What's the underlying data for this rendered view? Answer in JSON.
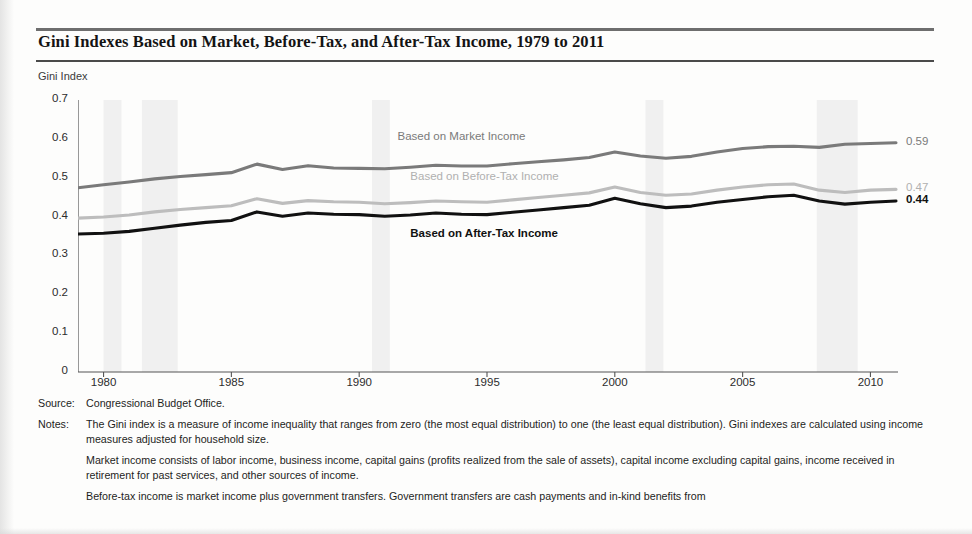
{
  "title": "Gini Indexes Based on Market, Before-Tax, and After-Tax Income, 1979 to 2011",
  "axis_title": "Gini Index",
  "source": {
    "tag": "Source:",
    "text": "Congressional Budget Office."
  },
  "notes": {
    "tag": "Notes:",
    "paragraphs": [
      "The Gini index is a measure of income inequality that ranges from zero (the most equal distribution) to one (the least equal distribution). Gini indexes are calculated using income measures adjusted for household size.",
      "Market income consists of labor income, business income, capital gains (profits realized from the sale of assets), capital income excluding capital gains, income received in retirement for past services, and other sources of income.",
      "Before-tax income is market income plus government transfers. Government transfers are cash payments and in-kind benefits from"
    ]
  },
  "colors": {
    "market": "#7a7a7a",
    "before_tax": "#bdbdbd",
    "after_tax": "#111111",
    "axis": "#555555",
    "band": "#f0f0f0"
  },
  "chart_data": {
    "type": "line",
    "title": "Gini Indexes Based on Market, Before-Tax, and After-Tax Income, 1979 to 2011",
    "xlabel": "",
    "ylabel": "Gini Index",
    "ylim": [
      0,
      0.7
    ],
    "xlim": [
      1979,
      2011
    ],
    "grid": false,
    "legend_position": "inline-labels",
    "ytick_labels": [
      "0",
      "0.1",
      "0.2",
      "0.3",
      "0.4",
      "0.5",
      "0.6",
      "0.7"
    ],
    "ytick_values": [
      0,
      0.1,
      0.2,
      0.3,
      0.4,
      0.5,
      0.6,
      0.7
    ],
    "xtick_labels": [
      "1980",
      "1985",
      "1990",
      "1995",
      "2000",
      "2005",
      "2010"
    ],
    "xtick_values": [
      1980,
      1985,
      1990,
      1995,
      2000,
      2005,
      2010
    ],
    "x": [
      1979,
      1980,
      1981,
      1982,
      1983,
      1984,
      1985,
      1986,
      1987,
      1988,
      1989,
      1990,
      1991,
      1992,
      1993,
      1994,
      1995,
      1996,
      1997,
      1998,
      1999,
      2000,
      2001,
      2002,
      2003,
      2004,
      2005,
      2006,
      2007,
      2008,
      2009,
      2010,
      2011
    ],
    "series": [
      {
        "name": "Based on Market Income",
        "color": "#7a7a7a",
        "end_label": "0.59",
        "label_x": 1991.5,
        "label_y": 0.602,
        "values": [
          0.474,
          0.482,
          0.489,
          0.497,
          0.503,
          0.508,
          0.513,
          0.535,
          0.521,
          0.531,
          0.525,
          0.524,
          0.523,
          0.527,
          0.532,
          0.53,
          0.53,
          0.536,
          0.541,
          0.546,
          0.552,
          0.566,
          0.556,
          0.55,
          0.555,
          0.566,
          0.575,
          0.58,
          0.581,
          0.578,
          0.586,
          0.588,
          0.59
        ]
      },
      {
        "name": "Based on Before-Tax Income",
        "color": "#bdbdbd",
        "end_label": "0.47",
        "label_x": 1992.0,
        "label_y": 0.5,
        "values": [
          0.396,
          0.399,
          0.404,
          0.412,
          0.418,
          0.423,
          0.428,
          0.446,
          0.434,
          0.441,
          0.438,
          0.437,
          0.433,
          0.436,
          0.44,
          0.438,
          0.437,
          0.443,
          0.449,
          0.455,
          0.461,
          0.476,
          0.462,
          0.455,
          0.458,
          0.468,
          0.476,
          0.482,
          0.484,
          0.468,
          0.462,
          0.468,
          0.47
        ]
      },
      {
        "name": "Based on After-Tax Income",
        "color": "#111111",
        "end_label": "0.44",
        "label_x": 1992.0,
        "label_y": 0.352,
        "values": [
          0.355,
          0.357,
          0.362,
          0.37,
          0.378,
          0.385,
          0.39,
          0.412,
          0.401,
          0.409,
          0.406,
          0.405,
          0.401,
          0.404,
          0.409,
          0.406,
          0.405,
          0.411,
          0.417,
          0.423,
          0.429,
          0.447,
          0.433,
          0.423,
          0.427,
          0.437,
          0.444,
          0.451,
          0.455,
          0.44,
          0.432,
          0.437,
          0.44
        ]
      }
    ],
    "shaded_bands": [
      {
        "from": 1980.0,
        "to": 1980.7
      },
      {
        "from": 1981.5,
        "to": 1982.9
      },
      {
        "from": 1990.5,
        "to": 1991.2
      },
      {
        "from": 2001.2,
        "to": 2001.9
      },
      {
        "from": 2007.9,
        "to": 2009.5
      }
    ]
  }
}
